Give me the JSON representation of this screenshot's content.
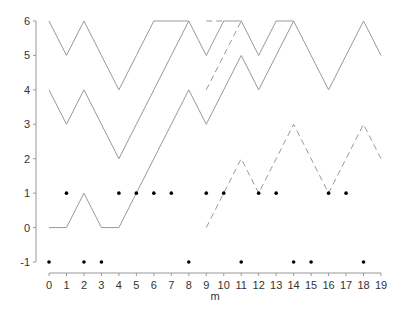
{
  "chart_data": {
    "type": "line",
    "title": "",
    "xlabel": "m",
    "ylabel": "",
    "xlim": [
      0,
      19
    ],
    "ylim": [
      -1,
      6
    ],
    "grid": false,
    "legend": null,
    "x_ticks": [
      0,
      1,
      2,
      3,
      4,
      5,
      6,
      7,
      8,
      9,
      10,
      11,
      12,
      13,
      14,
      15,
      16,
      17,
      18,
      19
    ],
    "y_ticks": [
      -1,
      0,
      1,
      2,
      3,
      4,
      5,
      6
    ],
    "series": [
      {
        "name": "path-top",
        "style": "solid",
        "color": "#999999",
        "points": [
          [
            0,
            6
          ],
          [
            1,
            5
          ],
          [
            2,
            6
          ],
          [
            3,
            5
          ],
          [
            4,
            4
          ],
          [
            5,
            5
          ],
          [
            6,
            6
          ],
          [
            7,
            6
          ],
          [
            8,
            6
          ],
          [
            9,
            5
          ],
          [
            10,
            6
          ],
          [
            11,
            6
          ],
          [
            12,
            5
          ],
          [
            13,
            6
          ],
          [
            14,
            6
          ],
          [
            15,
            5
          ],
          [
            16,
            4
          ],
          [
            17,
            5
          ],
          [
            18,
            6
          ],
          [
            19,
            5
          ]
        ]
      },
      {
        "name": "path-middle",
        "style": "solid",
        "color": "#999999",
        "points": [
          [
            0,
            4
          ],
          [
            1,
            3
          ],
          [
            2,
            4
          ],
          [
            3,
            3
          ],
          [
            4,
            2
          ],
          [
            5,
            3
          ],
          [
            6,
            4
          ],
          [
            7,
            5
          ],
          [
            8,
            6
          ]
        ]
      },
      {
        "name": "path-bottom",
        "style": "solid",
        "color": "#999999",
        "points": [
          [
            0,
            0
          ],
          [
            1,
            0
          ],
          [
            2,
            1
          ],
          [
            3,
            0
          ],
          [
            4,
            0
          ],
          [
            5,
            1
          ],
          [
            6,
            2
          ],
          [
            7,
            3
          ],
          [
            8,
            4
          ],
          [
            9,
            3
          ],
          [
            10,
            4
          ],
          [
            11,
            5
          ],
          [
            12,
            4
          ],
          [
            13,
            5
          ],
          [
            14,
            6
          ]
        ]
      },
      {
        "name": "dashed-top",
        "style": "dashed",
        "color": "#999999",
        "points": [
          [
            9,
            6
          ],
          [
            10,
            6
          ]
        ]
      },
      {
        "name": "dashed-diagonal",
        "style": "dashed",
        "color": "#999999",
        "points": [
          [
            9,
            4
          ],
          [
            10,
            5
          ],
          [
            11,
            6
          ]
        ]
      },
      {
        "name": "dashed-bottom",
        "style": "dashed",
        "color": "#999999",
        "points": [
          [
            9,
            0
          ],
          [
            10,
            1
          ],
          [
            11,
            2
          ],
          [
            12,
            1
          ],
          [
            13,
            2
          ],
          [
            14,
            3
          ],
          [
            15,
            2
          ],
          [
            16,
            1
          ],
          [
            17,
            2
          ],
          [
            18,
            3
          ],
          [
            19,
            2
          ]
        ]
      }
    ],
    "markers": [
      {
        "name": "dots-y1",
        "y": 1,
        "x": [
          1,
          4,
          5,
          6,
          7,
          9,
          10,
          12,
          13,
          16,
          17
        ],
        "color": "#000000"
      },
      {
        "name": "dots-y-minus1",
        "y": -1,
        "x": [
          0,
          2,
          3,
          8,
          11,
          14,
          15,
          18
        ],
        "color": "#000000"
      }
    ]
  },
  "axes": {
    "x_title": "m"
  }
}
